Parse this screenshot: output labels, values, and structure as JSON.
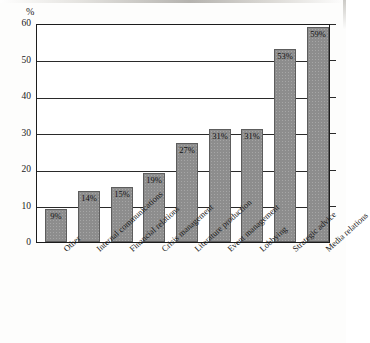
{
  "chart_data": {
    "type": "bar",
    "title": "",
    "subtitle": "",
    "xlabel": "",
    "ylabel": "%",
    "unit_label": "%",
    "ylim": [
      0,
      60
    ],
    "ytick_labels": [
      "0",
      "10",
      "20",
      "30",
      "40",
      "50",
      "60"
    ],
    "ytick_values": [
      0,
      10,
      20,
      30,
      40,
      50,
      60
    ],
    "grid": true,
    "grid_axis": "y",
    "legend": false,
    "legend_position": "none",
    "orientation": "vertical",
    "categories": [
      "Other",
      "Internal communications",
      "Financial relations",
      "Crisis management",
      "Literature production",
      "Event management",
      "Lobbying",
      "Strategic advice",
      "Media relations"
    ],
    "values": [
      9,
      14,
      15,
      19,
      27,
      31,
      31,
      53,
      59
    ],
    "data_labels": [
      "9%",
      "14%",
      "15%",
      "19%",
      "27%",
      "31%",
      "31%",
      "53%",
      "59%"
    ],
    "series": [
      {
        "name": "Share of respondents",
        "values": [
          9,
          14,
          15,
          19,
          27,
          31,
          31,
          53,
          59
        ]
      }
    ],
    "colors": {
      "bar_fill": "#8d8d8d",
      "bar_stroke": "#5d5d5d",
      "axis": "#1c1c1c",
      "grid": "#2a2a2a",
      "background": "#ffffff",
      "text": "#1a1a1a"
    }
  }
}
